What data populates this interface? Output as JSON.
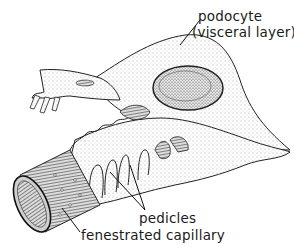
{
  "figure": {
    "labels": {
      "podocyte": "podocyte",
      "visceral_layer": "(visceral layer)",
      "pedicles": "pedicles",
      "fenestrated_capillary": "fenestrated capillary"
    },
    "colors": {
      "ink": "#1a1a1a",
      "background": "#ffffff",
      "stipple": "#9a9a9a"
    }
  }
}
